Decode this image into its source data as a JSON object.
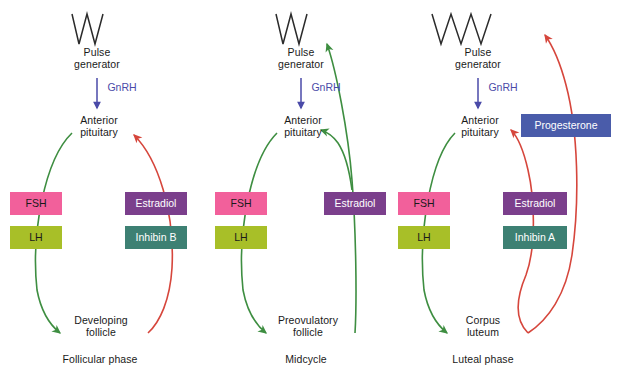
{
  "figure": {
    "colors": {
      "fsh_pink": "#F2609B",
      "lh_olive": "#A8BF28",
      "estradiol_purple": "#7B3F8C",
      "inhibin_teal": "#3D8073",
      "progesterone_blue": "#4A5CAA",
      "green_arrow": "#3E8E41",
      "red_arrow": "#D6463C",
      "gnrh_text": "#4A4AA8",
      "pulse_line": "#2b2b2b",
      "text": "#1a1a1a"
    }
  },
  "panels": [
    {
      "id": "follicular",
      "pulse_generator_label": "Pulse\ngenerator",
      "gnrh_label": "GnRH",
      "pituitary_label": "Anterior\npituitary",
      "target_label": "Developing\nfollicle",
      "phase_label": "Follicular phase",
      "pulse_peaks": 2,
      "left_boxes": [
        {
          "label": "FSH",
          "color": "#F2609B",
          "text_color": "#1a1a1a"
        },
        {
          "label": "LH",
          "color": "#A8BF28",
          "text_color": "#1a1a1a"
        }
      ],
      "right_boxes": [
        {
          "label": "Estradiol",
          "color": "#7B3F8C",
          "text_color": "#ffffff"
        },
        {
          "label": "Inhibin B",
          "color": "#3D8073",
          "text_color": "#ffffff"
        }
      ],
      "arrows": [
        {
          "name": "pituitary-to-follicle",
          "color": "#3E8E41",
          "direction": "down"
        },
        {
          "name": "follicle-to-pituitary",
          "color": "#D6463C",
          "direction": "up"
        }
      ]
    },
    {
      "id": "midcycle",
      "pulse_generator_label": "Pulse\ngenerator",
      "gnrh_label": "GnRH",
      "pituitary_label": "Anterior\npituitary",
      "target_label": "Preovulatory\nfollicle",
      "phase_label": "Midcycle",
      "pulse_peaks": 2,
      "left_boxes": [
        {
          "label": "FSH",
          "color": "#F2609B",
          "text_color": "#1a1a1a"
        },
        {
          "label": "LH",
          "color": "#A8BF28",
          "text_color": "#1a1a1a"
        }
      ],
      "right_boxes": [
        {
          "label": "Estradiol",
          "color": "#7B3F8C",
          "text_color": "#ffffff"
        }
      ],
      "arrows": [
        {
          "name": "pituitary-to-follicle",
          "color": "#3E8E41",
          "direction": "down"
        },
        {
          "name": "follicle-to-pulse-generator",
          "color": "#3E8E41",
          "direction": "up"
        },
        {
          "name": "follicle-to-pituitary",
          "color": "#3E8E41",
          "direction": "up"
        }
      ]
    },
    {
      "id": "luteal",
      "pulse_generator_label": "Pulse\ngenerator",
      "gnrh_label": "GnRH",
      "pituitary_label": "Anterior\npituitary",
      "target_label": "Corpus\nluteum",
      "phase_label": "Luteal phase",
      "pulse_peaks": 3,
      "left_boxes": [
        {
          "label": "FSH",
          "color": "#F2609B",
          "text_color": "#1a1a1a"
        },
        {
          "label": "LH",
          "color": "#A8BF28",
          "text_color": "#1a1a1a"
        }
      ],
      "right_boxes": [
        {
          "label": "Estradiol",
          "color": "#7B3F8C",
          "text_color": "#ffffff"
        },
        {
          "label": "Inhibin A",
          "color": "#3D8073",
          "text_color": "#ffffff"
        }
      ],
      "extra_boxes": [
        {
          "label": "Progesterone",
          "color": "#4A5CAA",
          "text_color": "#ffffff"
        }
      ],
      "arrows": [
        {
          "name": "pituitary-to-corpus-luteum",
          "color": "#3E8E41",
          "direction": "down"
        },
        {
          "name": "corpus-luteum-to-pituitary",
          "color": "#D6463C",
          "direction": "up"
        },
        {
          "name": "corpus-luteum-to-pulse-generator",
          "color": "#D6463C",
          "direction": "up"
        }
      ]
    }
  ]
}
